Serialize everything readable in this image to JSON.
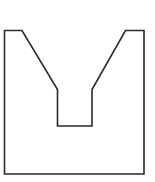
{
  "diagram": {
    "type": "outline-shape",
    "stroke_color": "#2a2a2a",
    "fill_color": "#ffffff",
    "stroke_width": 1.6,
    "points": "4.5,30.5 22,30.5 57.5,89.5 57.5,126 92,126 92,89.5 125.5,30.5 144,30.5 144,174 4.5,174"
  }
}
